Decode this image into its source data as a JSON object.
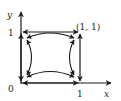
{
  "diagram": {
    "type": "phase-portrait",
    "axes": {
      "x_label": "x",
      "y_label": "y",
      "origin_label": "0",
      "x_tick_label": "1",
      "y_tick_label": "1"
    },
    "point_label": "(1, 1)",
    "colors": {
      "stroke": "#1a1a1a",
      "background": "#ffffff"
    }
  }
}
